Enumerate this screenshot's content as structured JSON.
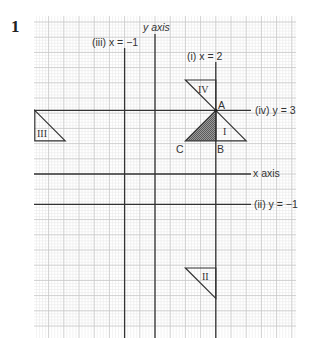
{
  "question_number": "1",
  "grid": {
    "left": 34,
    "top": 16,
    "right": 296,
    "bottom": 338,
    "unit_px": 15.2,
    "minor_px": 3.04,
    "origin_px": [
      155,
      174
    ],
    "major_color": "#c4c4c4",
    "minor_color": "#e6e6e6"
  },
  "axes": {
    "y_axis_label": "y axis",
    "x_axis_label": "x axis"
  },
  "lines": [
    {
      "id": "i",
      "label": "(i) x = 2"
    },
    {
      "id": "ii",
      "label": "(ii) y = −1"
    },
    {
      "id": "iii",
      "label": "(iii) x = −1"
    },
    {
      "id": "iv",
      "label": "(iv) y = 3"
    }
  ],
  "points": {
    "A": "A",
    "B": "B",
    "C": "C"
  },
  "shapes": {
    "original": "shaded triangle ABC",
    "images": [
      "I",
      "II",
      "III",
      "IV"
    ]
  },
  "chart_data": {
    "type": "diagram",
    "original_triangle": {
      "A": [
        2,
        3
      ],
      "B": [
        2,
        1
      ],
      "C": [
        0,
        1
      ]
    },
    "mirror_lines": [
      "x = 2",
      "y = -1",
      "x = -1",
      "y = 3"
    ],
    "images": {
      "I": {
        "mirror": "x = 2",
        "vertices": [
          [
            2,
            3
          ],
          [
            2,
            1
          ],
          [
            4,
            1
          ]
        ]
      },
      "II": {
        "mirror": "y = -1",
        "vertices": [
          [
            2,
            -5
          ],
          [
            2,
            -3
          ],
          [
            0,
            -3
          ]
        ]
      },
      "III": {
        "mirror": "x = -1",
        "vertices": [
          [
            -4,
            3
          ],
          [
            -4,
            1
          ],
          [
            -2,
            1
          ]
        ]
      },
      "IV": {
        "mirror": "y = 3",
        "vertices": [
          [
            2,
            3
          ],
          [
            2,
            5
          ],
          [
            0,
            5
          ]
        ]
      }
    },
    "xlabel": "x axis",
    "ylabel": "y axis",
    "grid": true
  }
}
